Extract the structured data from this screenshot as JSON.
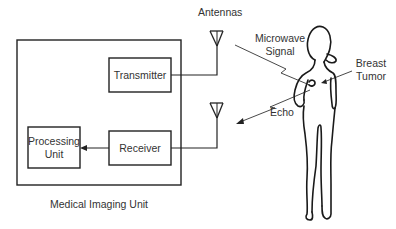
{
  "diagram": {
    "title": "Medical Imaging Unit",
    "blocks": {
      "transmitter": "Transmitter",
      "receiver": "Receiver",
      "processing_line1": "Processing",
      "processing_line2": "Unit"
    },
    "labels": {
      "antennas": "Antennas",
      "microwave_line1": "Microwave",
      "microwave_line2": "Signal",
      "echo": "Echo",
      "breast_line1": "Breast",
      "breast_line2": "Tumor"
    },
    "colors": {
      "stroke": "#222222",
      "text": "#333333",
      "background": "#ffffff"
    }
  }
}
